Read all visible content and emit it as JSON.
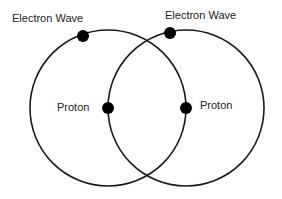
{
  "diagram": {
    "labels": {
      "electron_left": "Electron Wave",
      "electron_right": "Electron Wave",
      "proton_left": "Proton",
      "proton_right": "Proton"
    },
    "circles": [
      {
        "cx": 108,
        "cy": 108,
        "r": 78
      },
      {
        "cx": 186,
        "cy": 108,
        "r": 78
      }
    ],
    "dots": {
      "electron_left": {
        "x": 83,
        "y": 36
      },
      "electron_right": {
        "x": 170,
        "y": 33
      },
      "proton_left": {
        "x": 108,
        "y": 108
      },
      "proton_right": {
        "x": 186,
        "y": 108
      }
    },
    "colors": {
      "stroke": "#1a1a1a",
      "dot": "#000000"
    }
  }
}
